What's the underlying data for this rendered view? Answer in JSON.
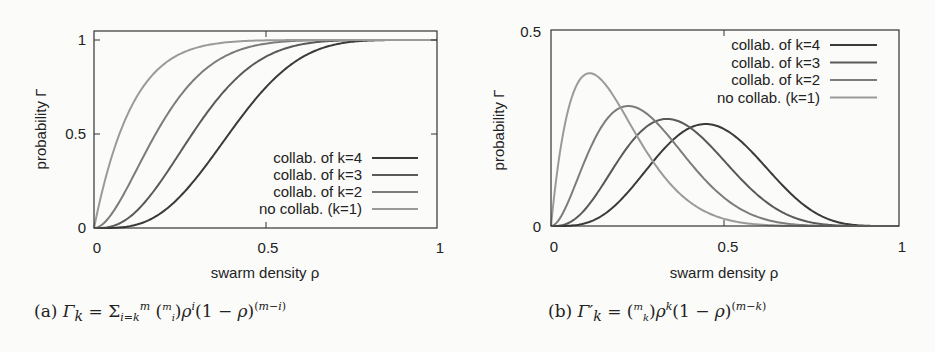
{
  "chart_data": [
    {
      "id": "a",
      "type": "line",
      "title": "",
      "xlabel": "swarm density ρ",
      "ylabel": "probability Γ",
      "xlim": [
        0,
        1
      ],
      "ylim": [
        0,
        1
      ],
      "xticks": [
        "0",
        "0.5",
        "1"
      ],
      "yticks": [
        "0",
        "0.5",
        "1"
      ],
      "grid": false,
      "legend_position": "lower right",
      "model": {
        "formula": "Gamma_k = sum_{i=k}^{m} C(m,i) rho^i (1-rho)^(m-i)",
        "m": 9
      },
      "x": [
        0,
        0.1,
        0.2,
        0.3,
        0.4,
        0.5,
        0.6,
        0.7,
        0.8,
        0.9,
        1.0
      ],
      "series": [
        {
          "name": "collab. of k=4",
          "k": 4,
          "color": "#3a3a3a",
          "values": [
            0,
            0.008,
            0.086,
            0.27,
            0.517,
            0.746,
            0.901,
            0.975,
            0.997,
            1.0,
            1.0
          ]
        },
        {
          "name": "collab. of k=3",
          "k": 3,
          "color": "#5a5a5a",
          "values": [
            0,
            0.053,
            0.262,
            0.537,
            0.768,
            0.91,
            0.975,
            0.996,
            1.0,
            1.0,
            1.0
          ]
        },
        {
          "name": "collab. of k=2",
          "k": 2,
          "color": "#7c7c7c",
          "values": [
            0,
            0.225,
            0.564,
            0.804,
            0.929,
            0.98,
            0.996,
            1.0,
            1.0,
            1.0,
            1.0
          ]
        },
        {
          "name": "no collab. (k=1)",
          "k": 1,
          "color": "#9a9a9a",
          "values": [
            0,
            0.613,
            0.866,
            0.96,
            0.99,
            0.998,
            1.0,
            1.0,
            1.0,
            1.0,
            1.0
          ]
        }
      ],
      "caption": {
        "label": "(a)",
        "formula": "Γ_k = Σ_{i=k}^{m} (m choose i) ρ^i (1 − ρ)^(m−i)"
      }
    },
    {
      "id": "b",
      "type": "line",
      "title": "",
      "xlabel": "swarm density ρ",
      "ylabel": "probability Γ",
      "xlim": [
        0,
        1
      ],
      "ylim": [
        0,
        0.5
      ],
      "xticks": [
        "0",
        "0.5",
        "1"
      ],
      "yticks": [
        "0",
        "0.5"
      ],
      "grid": false,
      "legend_position": "upper right",
      "model": {
        "formula": "Gamma'_k = C(m,k) rho^k (1-rho)^(m-k)",
        "m": 9
      },
      "x": [
        0,
        0.1,
        0.2,
        0.3,
        0.4,
        0.5,
        0.6,
        0.7,
        0.8,
        0.9,
        1.0
      ],
      "series": [
        {
          "name": "collab. of k=4",
          "k": 4,
          "color": "#3a3a3a",
          "values": [
            0,
            0.007,
            0.066,
            0.172,
            0.251,
            0.246,
            0.167,
            0.074,
            0.017,
            0.001,
            0
          ]
        },
        {
          "name": "collab. of k=3",
          "k": 3,
          "color": "#5a5a5a",
          "values": [
            0,
            0.045,
            0.176,
            0.267,
            0.251,
            0.164,
            0.074,
            0.021,
            0.003,
            0.0,
            0
          ]
        },
        {
          "name": "collab. of k=2",
          "k": 2,
          "color": "#7c7c7c",
          "values": [
            0,
            0.172,
            0.302,
            0.267,
            0.161,
            0.07,
            0.021,
            0.004,
            0.0,
            0.0,
            0
          ]
        },
        {
          "name": "no collab. (k=1)",
          "k": 1,
          "color": "#9a9a9a",
          "values": [
            0,
            0.387,
            0.302,
            0.156,
            0.06,
            0.018,
            0.004,
            0.001,
            0.0,
            0.0,
            0
          ]
        }
      ],
      "caption": {
        "label": "(b)",
        "formula": "Γ'_k = (m choose k) ρ^k (1 − ρ)^(m−k)"
      }
    }
  ]
}
